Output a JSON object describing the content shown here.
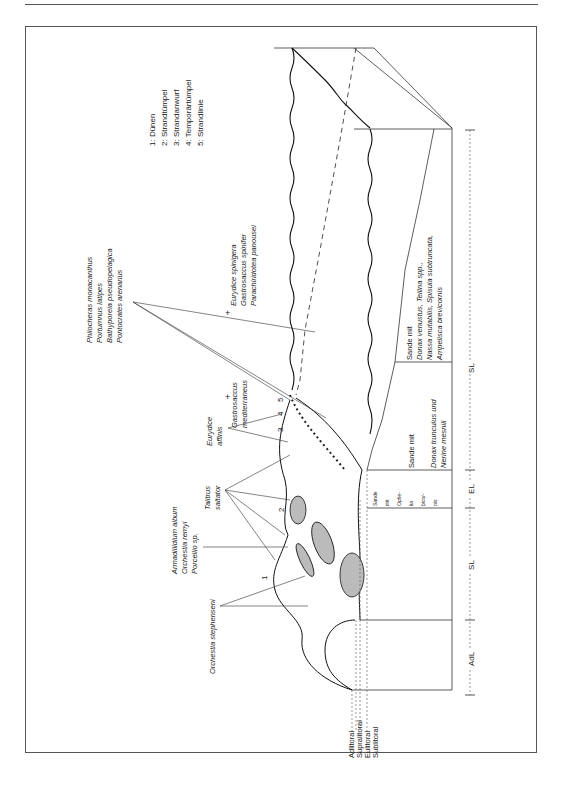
{
  "legend": {
    "items": [
      "1: Dünen",
      "2: Strandtümpel",
      "3: Strandanwurf",
      "4: Temporärtümpel",
      "5: Strandlinie"
    ]
  },
  "species_groups": {
    "offshore": [
      "Philocheras monacanthus",
      "Portumnus latipes",
      "Bathyporeia pseudopelagica",
      "Pontocrates arenarius"
    ],
    "subtidal": [
      "Eurydice spinigera",
      "Gastrosaccus spinifer",
      "Parachiridotea panousei"
    ],
    "gastrosaccus": [
      "Gastrosaccus",
      "mediterraneus"
    ],
    "eurydice_affinis": [
      "Eurydice",
      "affinis"
    ],
    "talitrus": [
      "Talitrus",
      "saltator"
    ],
    "armadillidium": [
      "Armadillidium album",
      "Orchestia remyi",
      "Porcellio sp."
    ],
    "orchestia": [
      "Orchestia stephenseni"
    ]
  },
  "sediment_boxes": {
    "box_outer": [
      "Sande mit",
      "Donax venustus,  Tellina spp.,",
      "Nassa mutabilis,  Spisula subtruncata,",
      "Ampelisca brevicornis"
    ],
    "box_middle": [
      "Sande mit",
      "",
      "Donax trunculus und",
      "Nerine mesnili"
    ],
    "box_narrow": [
      "Sande",
      "mit",
      "Ophe-",
      "lia",
      "bicor-",
      "nis"
    ]
  },
  "site_numbers": [
    "1",
    "2",
    "3",
    "4",
    "5"
  ],
  "plus_markers": [
    "+",
    "+"
  ],
  "zones": {
    "ruler": [
      "SL",
      "EL",
      "SL",
      "AdL"
    ]
  },
  "zone_legend": [
    "Adlitoral",
    "Supralitoral",
    "Eulitoral",
    "Sublitoral"
  ]
}
